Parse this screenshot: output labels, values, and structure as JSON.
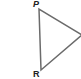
{
  "diagram": {
    "type": "triangle",
    "vertices": [
      {
        "label": "P",
        "x": 39,
        "y": 9
      },
      {
        "label": "R",
        "x": 41,
        "y": 70
      },
      {
        "label": "",
        "x": 82,
        "y": 35
      }
    ],
    "stroke_color": "#6b6b6b",
    "stroke_width": 1.5
  },
  "labels": {
    "p": "P",
    "r": "R"
  }
}
